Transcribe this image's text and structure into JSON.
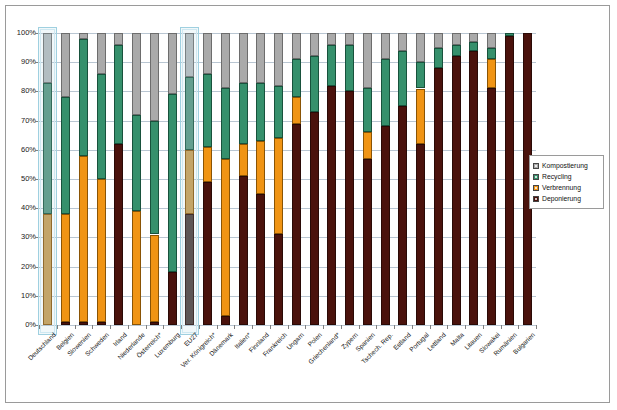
{
  "chart_data": {
    "type": "bar",
    "subtype": "stacked-100-percent-vertical",
    "title": "",
    "xlabel": "",
    "ylabel": "",
    "ylim": [
      0,
      100
    ],
    "ytick_labels": [
      "0%",
      "10%",
      "20%",
      "30%",
      "40%",
      "50%",
      "60%",
      "70%",
      "80%",
      "90%",
      "100%"
    ],
    "ytick_values": [
      0,
      10,
      20,
      30,
      40,
      50,
      60,
      70,
      80,
      90,
      100
    ],
    "grid": true,
    "legend_position": "right-middle",
    "stack_order_bottom_to_top": [
      "Deponierung",
      "Verbrennung",
      "Recycling",
      "Kompostierung"
    ],
    "categories": [
      "Deutschland",
      "Belgien",
      "Slowenien",
      "Schweden",
      "Irland",
      "Niederlande",
      "Österreich*",
      "Luxemburg",
      "EU27",
      "Ver. Königreich*",
      "Dänemark",
      "Italien*",
      "Finnland",
      "Frankreich",
      "Ungarn",
      "Polen",
      "Griechenland*",
      "Zypern",
      "Spanien",
      "Tschech. Rep.",
      "Estland",
      "Portugal",
      "Lettland",
      "Malta",
      "Litauen",
      "Slowakei",
      "Rumänien",
      "Bulgarien"
    ],
    "highlighted_categories": [
      "Deutschland",
      "EU27"
    ],
    "series": [
      {
        "name": "Deponierung",
        "color": "#4a120c",
        "values": [
          0,
          1,
          1,
          1,
          62,
          0,
          1,
          18,
          38,
          49,
          3,
          51,
          45,
          31,
          69,
          73,
          82,
          80,
          57,
          68,
          75,
          62,
          88,
          92,
          94,
          81,
          99,
          100
        ]
      },
      {
        "name": "Verbrennung",
        "color": "#f09414",
        "values": [
          38,
          37,
          57,
          49,
          0,
          39,
          30,
          0,
          22,
          12,
          54,
          11,
          18,
          33,
          9,
          0,
          0,
          0,
          9,
          0,
          0,
          19,
          0,
          0,
          0,
          10,
          0,
          0
        ]
      },
      {
        "name": "Recycling",
        "color": "#36906c",
        "values": [
          45,
          40,
          40,
          36,
          34,
          33,
          39,
          61,
          25,
          25,
          24,
          21,
          20,
          18,
          13,
          19,
          14,
          16,
          15,
          23,
          19,
          9,
          7,
          4,
          3,
          4,
          1,
          0
        ]
      },
      {
        "name": "Kompostierung",
        "color": "#aaaaaa",
        "values": [
          17,
          22,
          2,
          14,
          4,
          28,
          30,
          21,
          15,
          14,
          19,
          17,
          17,
          18,
          9,
          8,
          4,
          4,
          19,
          9,
          6,
          10,
          5,
          4,
          3,
          5,
          0,
          0
        ]
      }
    ]
  },
  "legend": {
    "items": [
      {
        "label": "Kompostierung",
        "color": "#aaaaaa"
      },
      {
        "label": "Recycling",
        "color": "#36906c"
      },
      {
        "label": "Verbrennung",
        "color": "#f09414"
      },
      {
        "label": "Deponierung",
        "color": "#4a120c"
      }
    ]
  }
}
